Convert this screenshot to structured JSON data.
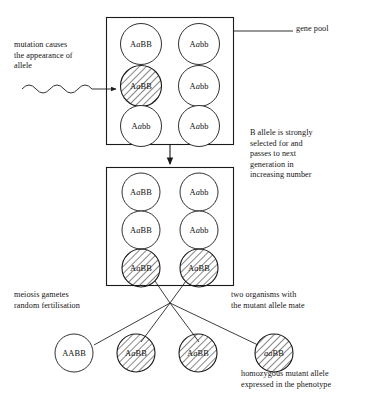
{
  "diagram": {
    "background_color": "#ffffff",
    "line_color": "#1a1a1a",
    "hatch_color": "#222222"
  },
  "annotations": {
    "mutation": "mutation causes\nthe appearance of\nallele",
    "gene_pool": "gene pool",
    "selection": "B allele is strongly\nselected for and\npasses to next\ngeneration in\nincreasing number",
    "meiosis": "meiosis gametes\nrandom fertilisation",
    "mating": "two organisms with\nthe mutant allele mate",
    "homozygous": "homozygous mutant allele\nexpressed in the phenotype"
  },
  "gene_pool_box_1": {
    "name": "gene pool generation one",
    "organisms": [
      {
        "genotype": "AaBB",
        "mutant": false
      },
      {
        "genotype": "Aabb",
        "mutant": false
      },
      {
        "genotype": "AaBB",
        "mutant": true
      },
      {
        "genotype": "Aabb",
        "mutant": false
      },
      {
        "genotype": "Aabb",
        "mutant": false
      },
      {
        "genotype": "Aabb",
        "mutant": false
      }
    ]
  },
  "gene_pool_box_2": {
    "name": "gene pool next generation",
    "organisms": [
      {
        "genotype": "AaBB",
        "mutant": false
      },
      {
        "genotype": "Aabb",
        "mutant": false
      },
      {
        "genotype": "AaBB",
        "mutant": false
      },
      {
        "genotype": "Aabb",
        "mutant": false
      },
      {
        "genotype": "AaBB",
        "mutant": true
      },
      {
        "genotype": "AaBB",
        "mutant": true
      }
    ]
  },
  "offspring": {
    "name": "offspring of the two mutant parents",
    "organisms": [
      {
        "genotype": "AABB",
        "mutant": false
      },
      {
        "genotype": "AaBB",
        "mutant": true
      },
      {
        "genotype": "AaBB",
        "mutant": true
      },
      {
        "genotype": "aaBB",
        "mutant": true
      }
    ]
  }
}
